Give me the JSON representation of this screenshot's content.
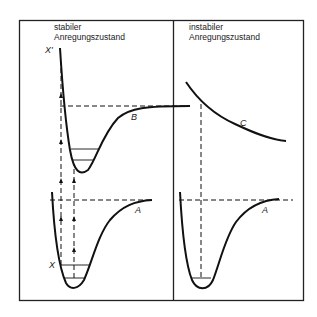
{
  "panels": {
    "left": {
      "title_line1": "stabiler",
      "title_line2": "Anregungszustand"
    },
    "right": {
      "title_line1": "instabiler",
      "title_line2": "Anregungszustand"
    }
  },
  "curves": {
    "upper_stable": "B",
    "lower_left": "A",
    "unstable": "C",
    "lower_right": "A"
  },
  "state_labels": {
    "ground": "X",
    "excited": "X'"
  },
  "colors": {
    "line": "#111111",
    "background": "#ffffff"
  }
}
